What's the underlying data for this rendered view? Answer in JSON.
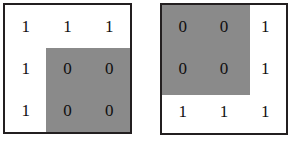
{
  "figure": {
    "background_color": "#ffffff",
    "shade_color": "#8a8a8a",
    "border_color": "#231f20",
    "digit_color": "#100f10",
    "panels": [
      {
        "name": "left-grid",
        "rows": [
          [
            "1",
            "1",
            "1"
          ],
          [
            "1",
            "0",
            "0"
          ],
          [
            "1",
            "0",
            "0"
          ]
        ],
        "shaded_region": {
          "start_row": 2,
          "start_col": 2,
          "row_span": 2,
          "col_span": 2,
          "position": "bottom-right"
        }
      },
      {
        "name": "right-grid",
        "rows": [
          [
            "0",
            "0",
            "1"
          ],
          [
            "0",
            "0",
            "1"
          ],
          [
            "1",
            "1",
            "1"
          ]
        ],
        "shaded_region": {
          "start_row": 1,
          "start_col": 1,
          "row_span": 2,
          "col_span": 2,
          "position": "top-left"
        }
      }
    ],
    "right_caption": ""
  }
}
